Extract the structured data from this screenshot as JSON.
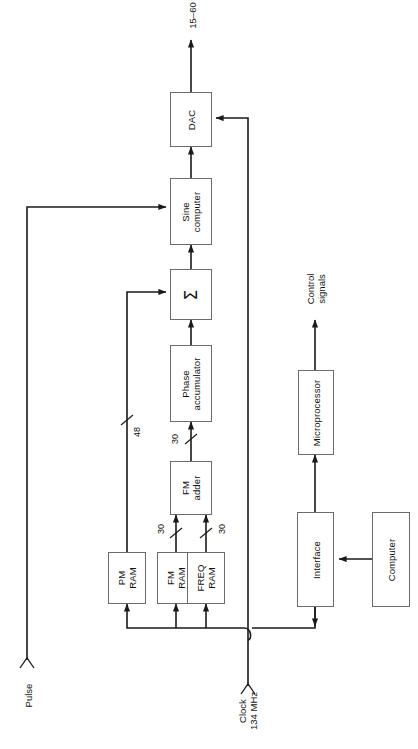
{
  "diagram": {
    "orientation": "rotated-90ccw",
    "line_color": "#1a1a1a",
    "box_border_color": "#6b6b6b",
    "background": "#ffffff",
    "blocks": [
      {
        "id": "dac",
        "label": "DAC"
      },
      {
        "id": "sine-computer",
        "label": "Sine\ncomputer",
        "line1": "Sine",
        "line2": "computer"
      },
      {
        "id": "summer",
        "label": "Σ"
      },
      {
        "id": "phase-accumulator",
        "label": "Phase\naccumulator",
        "line1": "Phase",
        "line2": "accumulator"
      },
      {
        "id": "fm-adder",
        "label": "FM\nadder",
        "line1": "FM",
        "line2": "adder"
      },
      {
        "id": "pm-ram",
        "label": "PM\nRAM",
        "line1": "PM",
        "line2": "RAM"
      },
      {
        "id": "fm-ram",
        "label": "FM\nRAM",
        "line1": "FM",
        "line2": "RAM"
      },
      {
        "id": "freq-ram",
        "label": "FREQ\nRAM",
        "line1": "FREQ",
        "line2": "RAM"
      },
      {
        "id": "microprocessor",
        "label": "Microprocessor"
      },
      {
        "id": "interface",
        "label": "Interface"
      },
      {
        "id": "computer",
        "label": "Computer"
      }
    ],
    "signal_labels": {
      "output_range": "15–60",
      "pulse": "Pulse",
      "clock_line1": "Clock",
      "clock_line2": "134 MHz",
      "control_line1": "Control",
      "control_line2": "signals"
    },
    "bus_widths": {
      "pm_to_summer": "48",
      "fm_adder_to_phase_accumulator": "30",
      "fm_ram_to_fm_adder": "30",
      "freq_ram_to_fm_adder": "30"
    }
  }
}
